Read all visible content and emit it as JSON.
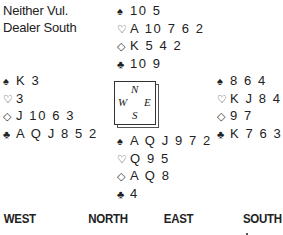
{
  "deal_info": {
    "vulnerability": "Neither Vul.",
    "dealer": "Dealer South"
  },
  "suit_symbols": {
    "spades": "♠",
    "hearts": "♡",
    "diamonds": "◇",
    "clubs": "♣"
  },
  "hands": {
    "north": {
      "spades": "10 5",
      "hearts": "A 10 7 6 2",
      "diamonds": "K 5 4 2",
      "clubs": "10 9"
    },
    "west": {
      "spades": "K 3",
      "hearts": "3",
      "diamonds": "J 10 6 3",
      "clubs": "A Q J 8 5 2"
    },
    "east": {
      "spades": "8 6 4",
      "hearts": "K J 8 4",
      "diamonds": "9 7",
      "clubs": "K 7 6 3"
    },
    "south": {
      "spades": "A Q J 9 7 2",
      "hearts": "Q 9 5",
      "diamonds": "A Q 8",
      "clubs": "4"
    }
  },
  "compass": {
    "north": "N",
    "south": "S",
    "west": "W",
    "east": "E"
  },
  "bidding": {
    "headers": [
      "WEST",
      "NORTH",
      "EAST",
      "SOUTH"
    ]
  }
}
